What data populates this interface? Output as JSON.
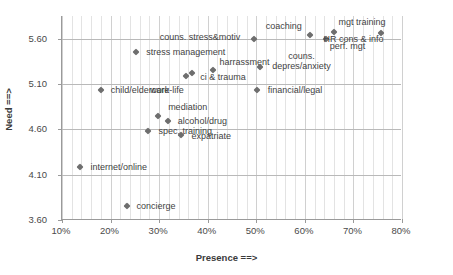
{
  "chart_data": {
    "type": "scatter",
    "title": "",
    "xlabel": "Presence ==>",
    "ylabel": "Need ==>",
    "xlim": [
      0.1,
      0.8
    ],
    "ylim": [
      3.6,
      5.85
    ],
    "xticks": [
      "10%",
      "20%",
      "30%",
      "40%",
      "50%",
      "60%",
      "70%",
      "80%"
    ],
    "xtick_values": [
      0.1,
      0.2,
      0.3,
      0.4,
      0.5,
      0.6,
      0.7,
      0.8
    ],
    "yticks": [
      "5.60",
      "5.10",
      "4.60",
      "4.10",
      "3.60"
    ],
    "ytick_values": [
      5.6,
      5.1,
      4.6,
      4.1,
      3.6
    ],
    "grid": "both",
    "legend": "none",
    "marker_color": "#6e6e6e",
    "points": [
      {
        "label": "internet/online",
        "x": 0.14,
        "y": 4.185,
        "lx": 10,
        "ly": -5
      },
      {
        "label": "concierge",
        "x": 0.235,
        "y": 3.755,
        "lx": 10,
        "ly": -5
      },
      {
        "label": "child/eldercare",
        "x": 0.182,
        "y": 5.035,
        "lx": 10,
        "ly": -5
      },
      {
        "label": "stress management",
        "x": 0.255,
        "y": 5.455,
        "lx": 10,
        "ly": -5
      },
      {
        "label": "spec. training",
        "x": 0.28,
        "y": 4.585,
        "lx": 10,
        "ly": -5
      },
      {
        "label": "mediation",
        "x": 0.3,
        "y": 4.745,
        "lx": 10,
        "ly": -14
      },
      {
        "label": "alcohol/drug",
        "x": 0.32,
        "y": 4.69,
        "lx": 10,
        "ly": -5
      },
      {
        "label": "expatriate",
        "x": 0.348,
        "y": 4.535,
        "lx": 10,
        "ly": -4
      },
      {
        "label": "work-life",
        "x": 0.358,
        "y": 5.185,
        "lx": -36,
        "ly": 9
      },
      {
        "label": "ci & trauma",
        "x": 0.37,
        "y": 5.225,
        "lx": 8,
        "ly": -1
      },
      {
        "label": "harrassment",
        "x": 0.412,
        "y": 5.255,
        "lx": 7,
        "ly": -13
      },
      {
        "label": "couns. stress&motiv",
        "x": 0.497,
        "y": 5.595,
        "lx": -94,
        "ly": -7
      },
      {
        "label": "couns.\ndepres/anxiety",
        "x": 0.51,
        "y": 5.285,
        "lx": 12,
        "ly": -16
      },
      {
        "label": "financial/legal",
        "x": 0.503,
        "y": 5.03,
        "lx": 11,
        "ly": -5
      },
      {
        "label": "coaching",
        "x": 0.612,
        "y": 5.64,
        "lx": -44,
        "ly": -14
      },
      {
        "label": "perf. mgt",
        "x": 0.645,
        "y": 5.6,
        "lx": 4,
        "ly": 2
      },
      {
        "label": "mgt training",
        "x": 0.663,
        "y": 5.678,
        "lx": 4,
        "ly": -15
      },
      {
        "label": "HR cons & info",
        "x": 0.758,
        "y": 5.66,
        "lx": -57,
        "ly": 1
      }
    ]
  }
}
